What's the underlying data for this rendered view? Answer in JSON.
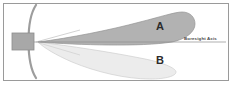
{
  "figure": {
    "frame": {
      "border_color": "#9a9a9a",
      "background_color": "#ffffff"
    },
    "reflector": {
      "name": "parabolic reflector dish",
      "color": "#9d9d9d"
    },
    "feed": {
      "name": "waveguide feed block",
      "fill_color": "#a8a8a8",
      "stroke_color": "#8a8a8a"
    },
    "lobes": [
      {
        "id": "A",
        "label": "A",
        "position": "upper",
        "fill_color": "#b2b2b2",
        "stroke_color": "#8f8f8f"
      },
      {
        "id": "B",
        "label": "B",
        "position": "lower",
        "fill_color": "#ececec",
        "stroke_color": "#c9c9c9"
      }
    ],
    "axis": {
      "label": "Boresight Axis",
      "line_color": "#8e8e8e"
    }
  }
}
